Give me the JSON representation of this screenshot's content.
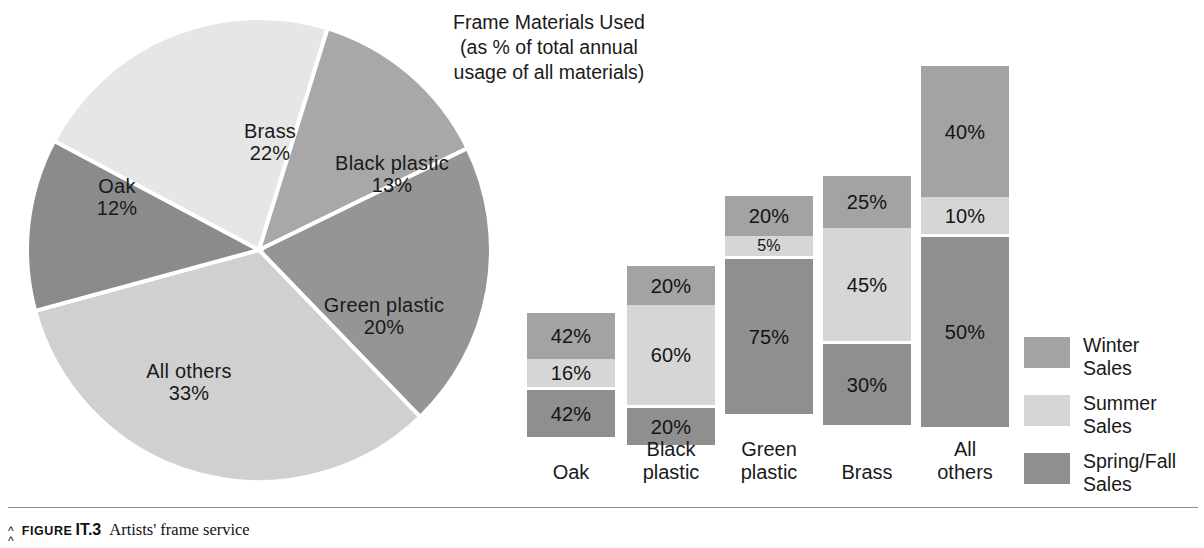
{
  "title": {
    "line1": "Frame Materials Used",
    "line2": "(as % of total annual",
    "line3": "usage of all materials)"
  },
  "caption": {
    "marker": "⌃",
    "figure_word": "FIGURE",
    "figure_number": "IT.3",
    "text": "Artists' frame service"
  },
  "legend": {
    "items": [
      {
        "line1": "Winter",
        "line2": "Sales",
        "color": "#a3a3a3"
      },
      {
        "line1": "Summer",
        "line2": "Sales",
        "color": "#d6d6d6"
      },
      {
        "line1": "Spring/Fall",
        "line2": "Sales",
        "color": "#8f8f8f"
      }
    ]
  },
  "chart_data": [
    {
      "type": "pie",
      "title": "Frame Materials Used (as % of total annual usage of all materials)",
      "legend_position": "in-slice labels",
      "categories": [
        "Brass",
        "Black plastic",
        "Green plastic",
        "All others",
        "Oak"
      ],
      "values": [
        22,
        13,
        20,
        33,
        12
      ],
      "value_labels": [
        "22%",
        "13%",
        "20%",
        "33%",
        "12%"
      ],
      "colors": [
        "#e6e6e6",
        "#a8a8a8",
        "#959595",
        "#d0d0d0",
        "#8b8b8b"
      ],
      "slices": [
        {
          "label": "Brass",
          "value": 22,
          "value_label": "22%",
          "color": "#e6e6e6"
        },
        {
          "label": "Black plastic",
          "value": 13,
          "value_label": "13%",
          "color": "#a8a8a8"
        },
        {
          "label": "Green plastic",
          "value": 20,
          "value_label": "20%",
          "color": "#959595"
        },
        {
          "label": "All others",
          "value": 33,
          "value_label": "33%",
          "color": "#d0d0d0"
        },
        {
          "label": "Oak",
          "value": 12,
          "value_label": "12%",
          "color": "#8b8b8b"
        }
      ]
    },
    {
      "type": "bar",
      "subtype": "stacked",
      "title": "",
      "xlabel": "",
      "ylabel": "",
      "grid": false,
      "legend_position": "right",
      "categories": [
        "Oak",
        "Black plastic",
        "Green plastic",
        "Brass",
        "All others"
      ],
      "series": [
        {
          "name": "Winter Sales",
          "color": "#a3a3a3",
          "values": [
            42,
            20,
            20,
            25,
            40
          ]
        },
        {
          "name": "Summer Sales",
          "color": "#d6d6d6",
          "values": [
            16,
            60,
            5,
            45,
            10
          ]
        },
        {
          "name": "Spring/Fall Sales",
          "color": "#8f8f8f",
          "values": [
            42,
            20,
            75,
            30,
            50
          ]
        }
      ],
      "bar_total_heights_px": [
        115,
        162,
        232,
        252,
        362
      ]
    }
  ],
  "pie": {
    "labels": [
      {
        "name": "Brass",
        "pct": "22%",
        "x": 196,
        "y": 108,
        "w": 120
      },
      {
        "name": "Black plastic",
        "pct": "13%",
        "x": 298,
        "y": 140,
        "w": 160
      },
      {
        "name": "Green plastic",
        "pct": "20%",
        "x": 290,
        "y": 282,
        "w": 160
      },
      {
        "name": "All others",
        "pct": "33%",
        "x": 100,
        "y": 348,
        "w": 150
      },
      {
        "name": "Oak",
        "pct": "12%",
        "x": 48,
        "y": 163,
        "w": 110
      }
    ]
  },
  "bars": {
    "columns": [
      {
        "category_line1": "Oak",
        "category_line2": "",
        "left": 22,
        "total_px": 115,
        "segments": [
          {
            "series": "Winter Sales",
            "label": "42%",
            "px": 46,
            "color": "#a3a3a3"
          },
          {
            "series": "Summer Sales",
            "label": "16%",
            "px": 28,
            "color": "#d6d6d6"
          },
          {
            "series": "Spring/Fall Sales",
            "label": "42%",
            "px": 47,
            "color": "#8f8f8f"
          }
        ]
      },
      {
        "category_line1": "Black",
        "category_line2": "plastic",
        "left": 122,
        "total_px": 162,
        "segments": [
          {
            "series": "Winter Sales",
            "label": "20%",
            "px": 39,
            "color": "#a3a3a3"
          },
          {
            "series": "Summer Sales",
            "label": "60%",
            "px": 100,
            "color": "#d6d6d6"
          },
          {
            "series": "Spring/Fall Sales",
            "label": "20%",
            "px": 37,
            "color": "#8f8f8f"
          }
        ]
      },
      {
        "category_line1": "Green",
        "category_line2": "plastic",
        "left": 220,
        "total_px": 232,
        "segments": [
          {
            "series": "Winter Sales",
            "label": "20%",
            "px": 40,
            "color": "#a3a3a3"
          },
          {
            "series": "Summer Sales",
            "label": "5%",
            "px": 20,
            "color": "#d6d6d6"
          },
          {
            "series": "Spring/Fall Sales",
            "label": "75%",
            "px": 155,
            "color": "#8f8f8f"
          }
        ]
      },
      {
        "category_line1": "Brass",
        "category_line2": "",
        "left": 318,
        "total_px": 252,
        "segments": [
          {
            "series": "Winter Sales",
            "label": "25%",
            "px": 52,
            "color": "#a3a3a3"
          },
          {
            "series": "Summer Sales",
            "label": "45%",
            "px": 113,
            "color": "#d6d6d6"
          },
          {
            "series": "Spring/Fall Sales",
            "label": "30%",
            "px": 81,
            "color": "#8f8f8f"
          }
        ]
      },
      {
        "category_line1": "All",
        "category_line2": "others",
        "left": 416,
        "total_px": 362,
        "segments": [
          {
            "series": "Winter Sales",
            "label": "40%",
            "px": 131,
            "color": "#a3a3a3"
          },
          {
            "series": "Summer Sales",
            "label": "10%",
            "px": 37,
            "color": "#d6d6d6"
          },
          {
            "series": "Spring/Fall Sales",
            "label": "50%",
            "px": 190,
            "color": "#8f8f8f"
          }
        ]
      }
    ]
  }
}
